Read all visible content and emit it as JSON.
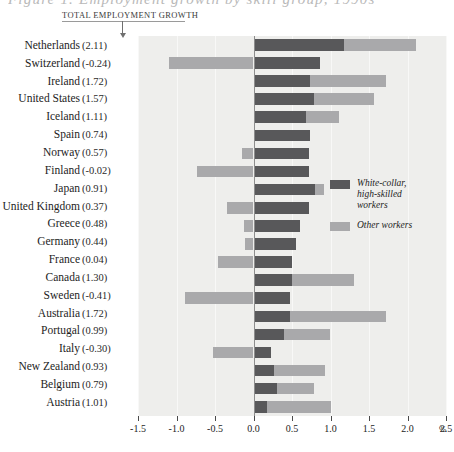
{
  "figure": {
    "clipped_title": "Figure 1.  Employment growth by skill group, 1990s",
    "annotation_label": "TOTAL EMPLOYMENT GROWTH"
  },
  "legend": {
    "position": "inside-right",
    "items": [
      {
        "name": "white-collar-high-skilled-workers",
        "label": "White-collar,\nhigh-skilled\nworkers",
        "color": "#58585a"
      },
      {
        "name": "other-workers",
        "label": "Other workers",
        "color": "#a9a9ab"
      }
    ]
  },
  "axis": {
    "ticks": [
      "-1.5",
      "-1.0",
      "-0.5",
      "0.0",
      "0.5",
      "1.0",
      "1.5",
      "2.0",
      "2.5"
    ],
    "tick_values": [
      -1.5,
      -1.0,
      -0.5,
      0.0,
      0.5,
      1.0,
      1.5,
      2.0,
      2.5
    ],
    "unit": "%"
  },
  "chart_data": {
    "type": "bar",
    "orientation": "horizontal",
    "stacked": true,
    "title": "Figure 1.  Employment growth by skill group, 1990s",
    "xlabel": "%",
    "ylabel": "",
    "xlim": [
      -1.5,
      2.5
    ],
    "grid": true,
    "legend_position": "inside-right",
    "categories": [
      "Netherlands",
      "Switzerland",
      "Ireland",
      "United States",
      "Iceland",
      "Spain",
      "Norway",
      "Finland",
      "Japan",
      "United Kingdom",
      "Greece",
      "Germany",
      "France",
      "Canada",
      "Sweden",
      "Australia",
      "Portugal",
      "Italy",
      "New Zealand",
      "Belgium",
      "Austria"
    ],
    "totals_label": "TOTAL EMPLOYMENT GROWTH",
    "totals": [
      2.11,
      -0.24,
      1.72,
      1.57,
      1.11,
      0.74,
      0.57,
      -0.02,
      0.91,
      0.37,
      0.48,
      0.44,
      0.04,
      1.3,
      -0.41,
      1.72,
      0.99,
      -0.3,
      0.93,
      0.79,
      1.01
    ],
    "totals_display": [
      "(2.11)",
      "(-0.24)",
      "(1.72)",
      "(1.57)",
      "(1.11)",
      "(0.74)",
      "(0.57)",
      "(-0.02)",
      "(0.91)",
      "(0.37)",
      "(0.48)",
      "(0.44)",
      "(0.04)",
      "(1.30)",
      "(-0.41)",
      "(1.72)",
      "(0.99)",
      "(-0.30)",
      "(0.93)",
      "(0.79)",
      "(1.01)"
    ],
    "series": [
      {
        "name": "White-collar, high-skilled workers",
        "color": "#58585a",
        "values": [
          1.18,
          0.86,
          0.73,
          0.78,
          0.68,
          0.74,
          0.72,
          0.72,
          0.8,
          0.72,
          0.6,
          0.55,
          0.5,
          0.5,
          0.48,
          0.47,
          0.4,
          0.23,
          0.27,
          0.3,
          0.18
        ]
      },
      {
        "name": "Other workers",
        "color": "#a9a9ab",
        "values": [
          0.93,
          -1.1,
          0.99,
          0.79,
          0.43,
          0.0,
          -0.15,
          -0.74,
          0.11,
          -0.35,
          -0.12,
          -0.11,
          -0.46,
          0.8,
          -0.89,
          1.25,
          0.59,
          -0.53,
          0.66,
          0.49,
          0.83
        ]
      }
    ],
    "rows": [
      {
        "country": "Netherlands",
        "total": 2.11,
        "total_display": "(2.11)",
        "dark": 1.18,
        "light": 0.93
      },
      {
        "country": "Switzerland",
        "total": -0.24,
        "total_display": "(-0.24)",
        "dark": 0.86,
        "light": -1.1
      },
      {
        "country": "Ireland",
        "total": 1.72,
        "total_display": "(1.72)",
        "dark": 0.73,
        "light": 0.99
      },
      {
        "country": "United States",
        "total": 1.57,
        "total_display": "(1.57)",
        "dark": 0.78,
        "light": 0.79
      },
      {
        "country": "Iceland",
        "total": 1.11,
        "total_display": "(1.11)",
        "dark": 0.68,
        "light": 0.43
      },
      {
        "country": "Spain",
        "total": 0.74,
        "total_display": "(0.74)",
        "dark": 0.74,
        "light": 0.0
      },
      {
        "country": "Norway",
        "total": 0.57,
        "total_display": "(0.57)",
        "dark": 0.72,
        "light": -0.15
      },
      {
        "country": "Finland",
        "total": -0.02,
        "total_display": "(-0.02)",
        "dark": 0.72,
        "light": -0.74
      },
      {
        "country": "Japan",
        "total": 0.91,
        "total_display": "(0.91)",
        "dark": 0.8,
        "light": 0.11
      },
      {
        "country": "United Kingdom",
        "total": 0.37,
        "total_display": "(0.37)",
        "dark": 0.72,
        "light": -0.35
      },
      {
        "country": "Greece",
        "total": 0.48,
        "total_display": "(0.48)",
        "dark": 0.6,
        "light": -0.12
      },
      {
        "country": "Germany",
        "total": 0.44,
        "total_display": "(0.44)",
        "dark": 0.55,
        "light": -0.11
      },
      {
        "country": "France",
        "total": 0.04,
        "total_display": "(0.04)",
        "dark": 0.5,
        "light": -0.46
      },
      {
        "country": "Canada",
        "total": 1.3,
        "total_display": "(1.30)",
        "dark": 0.5,
        "light": 0.8
      },
      {
        "country": "Sweden",
        "total": -0.41,
        "total_display": "(-0.41)",
        "dark": 0.48,
        "light": -0.89
      },
      {
        "country": "Australia",
        "total": 1.72,
        "total_display": "(1.72)",
        "dark": 0.47,
        "light": 1.25
      },
      {
        "country": "Portugal",
        "total": 0.99,
        "total_display": "(0.99)",
        "dark": 0.4,
        "light": 0.59
      },
      {
        "country": "Italy",
        "total": -0.3,
        "total_display": "(-0.30)",
        "dark": 0.23,
        "light": -0.53
      },
      {
        "country": "New Zealand",
        "total": 0.93,
        "total_display": "(0.93)",
        "dark": 0.27,
        "light": 0.66
      },
      {
        "country": "Belgium",
        "total": 0.79,
        "total_display": "(0.79)",
        "dark": 0.3,
        "light": 0.49
      },
      {
        "country": "Austria",
        "total": 1.01,
        "total_display": "(1.01)",
        "dark": 0.18,
        "light": 0.83
      }
    ]
  }
}
